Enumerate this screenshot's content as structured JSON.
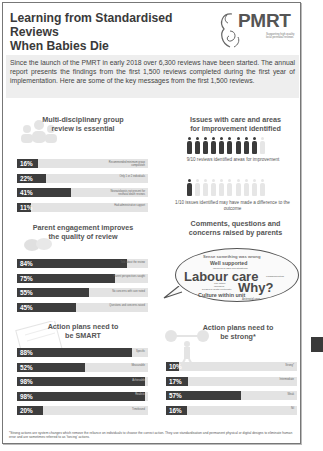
{
  "header": {
    "title_line1": "Learning from Standardised Reviews",
    "title_line2": "When Babies Die",
    "subtitle": "Key Messages – October 2019"
  },
  "logo": {
    "text": "PMRT",
    "tagline": "Supporting high quality local perinatal reviews"
  },
  "intro": {
    "text": "Since the launch of the PMRT in early 2018 over 6,300 reviews have been started. The annual report presents the findings from the first 1,500 reviews completed during the first year of implementation. Here are some of the key messages from the first 1,500 reviews."
  },
  "sections": {
    "multidisciplinary": {
      "title_line1": "Multi-disciplinary group",
      "title_line2": "review is essential",
      "icon": "group-people-icon",
      "bars": [
        {
          "pct": "16%",
          "value": 16,
          "label": "Recommended minimum group composition"
        },
        {
          "pct": "22%",
          "value": 22,
          "label": "Only 1 or 2 individuals"
        },
        {
          "pct": "41%",
          "value": 41,
          "label": "Neonatologists not present for neonatal death reviews"
        },
        {
          "pct": "11%",
          "value": 11,
          "label": "Had administrative support"
        }
      ]
    },
    "issues": {
      "title_line1": "Issues with care and areas",
      "title_line2": "for improvement identified",
      "icon": "pregnant-figure-icon",
      "row1_dark": 9,
      "row1_total": 10,
      "caption1": "9/10 reviews identified areas for improvement",
      "row2_dark": 1,
      "row2_total": 10,
      "caption2": "1/10 issues identified may have made a difference to the outcome"
    },
    "parent_engagement": {
      "title_line1": "Parent engagement improves",
      "title_line2": "the quality of review",
      "icon": "speech-bubbles-icon",
      "bars": [
        {
          "pct": "84%",
          "value": 84,
          "label": "Told about the review"
        },
        {
          "pct": "75%",
          "value": 75,
          "label": "Parent perspectives sought"
        },
        {
          "pct": "55%",
          "value": 55,
          "label": "No concerns with care noted"
        },
        {
          "pct": "45%",
          "value": 45,
          "label": "Questions and concerns raised"
        }
      ]
    },
    "comments": {
      "title_line1": "Comments, questions and",
      "title_line2": "concerns raised by parents",
      "icon": "speech-bubble-icon",
      "words": [
        "Sense something was wrong",
        "Well supported",
        "Involved in own investigations",
        "Labour care",
        "Communication",
        "The future",
        "Informed",
        "Delays in death certificate",
        "Why?",
        "Culture within unit",
        "Antenatal care"
      ]
    },
    "smart": {
      "title_line1": "Action plans need to",
      "title_line2": "be SMART",
      "icon": "checklist-icon",
      "bars": [
        {
          "pct": "88%",
          "value": 88,
          "label": "Specific"
        },
        {
          "pct": "52%",
          "value": 52,
          "label": "Measurable"
        },
        {
          "pct": "98%",
          "value": 98,
          "label": "Achievable"
        },
        {
          "pct": "98%",
          "value": 98,
          "label": "Realistic"
        },
        {
          "pct": "20%",
          "value": 20,
          "label": "Timebound"
        }
      ]
    },
    "strong": {
      "title_line1": "Action plans need to",
      "title_line2": "be strong*",
      "icon": "weightlifter-icon",
      "bars": [
        {
          "pct": "10%",
          "value": 10,
          "label": "Strong*"
        },
        {
          "pct": "17%",
          "value": 17,
          "label": "Intermediate"
        },
        {
          "pct": "57%",
          "value": 57,
          "label": "Weak"
        },
        {
          "pct": "16%",
          "value": 16,
          "label": "Nil"
        }
      ]
    }
  },
  "footnote": "*Strong actions are system changes which remove the reliance on individuals to choose the correct action. They use standardisation and permanent physical or digital designs to eliminate human error and are sometimes referred to as 'forcing' actions.",
  "colors": {
    "bar_dark": "#3d3d3d",
    "bar_track": "#e3e3e3",
    "intro_bg": "#eeeeee",
    "text": "#444444"
  }
}
